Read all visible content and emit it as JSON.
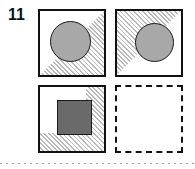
{
  "question": {
    "number": "11"
  },
  "colors": {
    "stroke": "#111111",
    "circle_fill": "#a8a8a8",
    "square_fill": "#6a6a6a",
    "hatch_line": "#b9b9b9",
    "background": "#ffffff",
    "cutline": "#9a9a9a"
  },
  "panels": [
    {
      "id": "panel-1",
      "position": "top-left",
      "border": "solid",
      "shading": "lower-right-triangle-hatch",
      "shape": "circle",
      "shape_fill": "#a8a8a8",
      "shape_position": "center-left",
      "x": 38,
      "y": 9,
      "w": 68,
      "h": 68
    },
    {
      "id": "panel-2",
      "position": "top-right",
      "border": "solid",
      "shading": "upper-left-triangle-hatch",
      "shape": "circle",
      "shape_fill": "#a8a8a8",
      "shape_position": "center-right",
      "x": 115,
      "y": 9,
      "w": 68,
      "h": 68
    },
    {
      "id": "panel-3",
      "position": "bottom-left",
      "border": "solid",
      "shading": "l-shape-hatch-right-and-bottom",
      "shape": "square",
      "shape_fill": "#6a6a6a",
      "shape_position": "center",
      "x": 38,
      "y": 85,
      "w": 68,
      "h": 68
    },
    {
      "id": "panel-4",
      "position": "bottom-right",
      "border": "dashed",
      "shading": "none",
      "shape": "none",
      "shape_fill": "",
      "shape_position": "",
      "x": 115,
      "y": 85,
      "w": 68,
      "h": 68
    }
  ],
  "cutline": {
    "style": "dotted",
    "label": "page-cut-line"
  }
}
